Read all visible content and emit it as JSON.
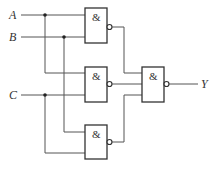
{
  "diagram": {
    "type": "logic-circuit",
    "inputs": [
      {
        "label": "A"
      },
      {
        "label": "B"
      },
      {
        "label": "C"
      }
    ],
    "output": {
      "label": "Y"
    },
    "gates": [
      {
        "id": "g1",
        "symbol": "&",
        "type": "NAND",
        "inputs": [
          "A",
          "B"
        ]
      },
      {
        "id": "g2",
        "symbol": "&",
        "type": "NAND",
        "inputs": [
          "A",
          "C"
        ]
      },
      {
        "id": "g3",
        "symbol": "&",
        "type": "NAND",
        "inputs": [
          "B",
          "C"
        ]
      },
      {
        "id": "g4",
        "symbol": "&",
        "type": "NAND",
        "inputs": [
          "g1",
          "g2",
          "g3"
        ]
      }
    ]
  }
}
